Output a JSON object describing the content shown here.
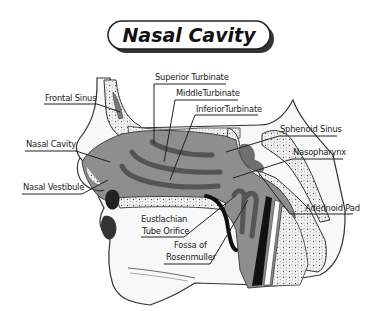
{
  "title": "Nasal Cavity",
  "labels": {
    "frontal_sinus": "Frontal Sinus",
    "nasal_cavity": "Nasal Cavity",
    "nasal_vestibule": "Nasal Vestibule",
    "superior_turbinate": "Superior Turbinate",
    "middle_turbinate": "MiddleTurbinate",
    "inferior_turbinate": "InferiorTurbinate",
    "sphenoid_sinus": "Sphenoid Sinus",
    "nasopharynx": "Nasopharynx",
    "adenoid_pad": "Adednoid Pad",
    "eustachian_line1": "Eustlachian",
    "eustachian_line2": "Tube Orifice",
    "fossa_line1": "Fossa of",
    "fossa_line2": "Rosenmuller"
  },
  "colors": {
    "cavity_gray": "#8c8c8c",
    "turbinate_dark": "#555555",
    "bone_light": "#f2f2f2",
    "skin": "#f7f7f7",
    "outline": "#333333",
    "black_structure": "#111111"
  }
}
